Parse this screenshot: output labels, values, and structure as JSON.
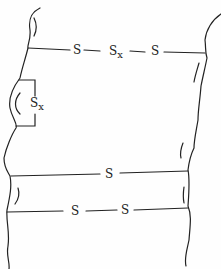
{
  "diagram": {
    "colors": {
      "line": "#222222",
      "background": "#fefefe"
    },
    "crosslinks": [
      {
        "id": "top",
        "atoms": [
          "S",
          "S",
          "S"
        ],
        "subscripts": [
          "",
          "x",
          ""
        ]
      },
      {
        "id": "loop",
        "atoms": [
          "S"
        ],
        "subscripts": [
          "x"
        ]
      },
      {
        "id": "middle",
        "atoms": [
          "S"
        ],
        "subscripts": [
          ""
        ]
      },
      {
        "id": "bottom",
        "atoms": [
          "S",
          "S"
        ],
        "subscripts": [
          "",
          ""
        ]
      }
    ]
  }
}
